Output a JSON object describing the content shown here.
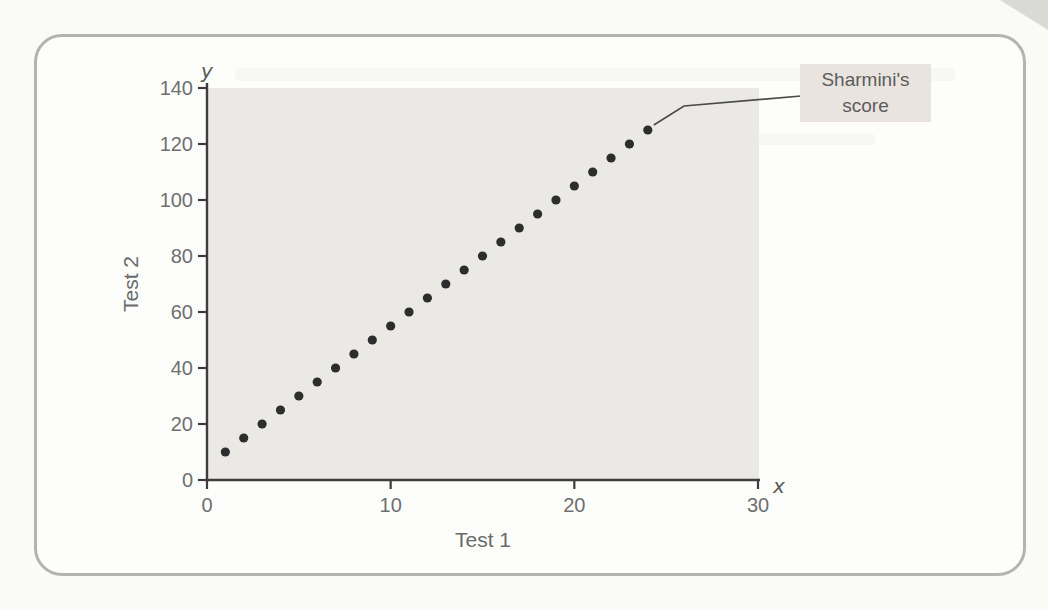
{
  "chart_data": {
    "type": "scatter",
    "title": "",
    "xlabel": "Test 1",
    "ylabel": "Test 2",
    "x_axis_letter": "x",
    "y_axis_letter": "y",
    "xlim": [
      0,
      30
    ],
    "ylim": [
      0,
      140
    ],
    "x_ticks": [
      0,
      10,
      20,
      30
    ],
    "y_ticks": [
      0,
      20,
      40,
      60,
      80,
      100,
      120,
      140
    ],
    "grid": "off",
    "points": [
      [
        1,
        10
      ],
      [
        2,
        15
      ],
      [
        3,
        20
      ],
      [
        4,
        25
      ],
      [
        5,
        30
      ],
      [
        6,
        35
      ],
      [
        7,
        40
      ],
      [
        8,
        45
      ],
      [
        9,
        50
      ],
      [
        10,
        55
      ],
      [
        11,
        60
      ],
      [
        12,
        65
      ],
      [
        13,
        70
      ],
      [
        14,
        75
      ],
      [
        15,
        80
      ],
      [
        16,
        85
      ],
      [
        17,
        90
      ],
      [
        18,
        95
      ],
      [
        19,
        100
      ],
      [
        20,
        105
      ],
      [
        21,
        110
      ],
      [
        22,
        115
      ],
      [
        23,
        120
      ],
      [
        24,
        125
      ]
    ],
    "annotation": {
      "label": "Sharmini's score",
      "target_point": [
        24,
        125
      ]
    }
  },
  "annotation": {
    "text_lines": [
      "Sharmini's",
      "score"
    ]
  },
  "colors": {
    "page_bg": "#fafaf7",
    "card_bg": "#fdfdfb",
    "frame_border": "#b3b3b1",
    "plot_bg": "#eae9e6",
    "axis": "#3d3d3d",
    "tick_label": "#6f6f6f",
    "point": "#2d2d2d",
    "annotation_bg": "#e9e4e0",
    "annotation_text": "#5c5c5c",
    "leader_line": "#4a4a4a",
    "page_corner": "#d9d9d6"
  }
}
